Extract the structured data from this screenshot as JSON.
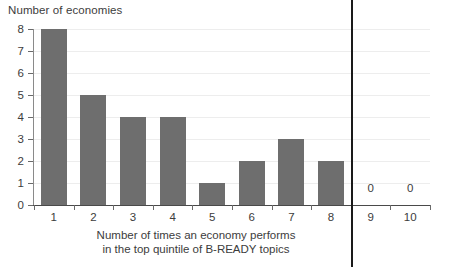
{
  "chart_data": {
    "type": "bar",
    "title": "",
    "ylabel": "Number of economies",
    "xlabel_lines": [
      "Number of times an economy performs",
      "in the top quintile of B-READY topics"
    ],
    "xlabel": "Number of times an economy performs in the top quintile of B-READY topics",
    "categories": [
      "1",
      "2",
      "3",
      "4",
      "5",
      "6",
      "7",
      "8",
      "9",
      "10"
    ],
    "values": [
      8,
      5,
      4,
      4,
      1,
      2,
      3,
      2,
      0,
      0
    ],
    "value_labels": [
      "",
      "",
      "",
      "",
      "",
      "",
      "",
      "",
      "0",
      "0"
    ],
    "ylim": [
      0,
      8
    ],
    "y_ticks": [
      "0",
      "1",
      "2",
      "3",
      "4",
      "5",
      "6",
      "7",
      "8"
    ],
    "grid": true,
    "legend": "none",
    "annotations": [
      {
        "name": "category-divider",
        "kind": "vertical-line",
        "after_category": "8",
        "description": "vertical rule separating categories 1-8 from 9-10"
      }
    ],
    "colors": {
      "bar": "#6e6e6e",
      "grid": "#ededed",
      "axis": "#4a4a4a",
      "divider": "#1a1a1a",
      "text": "#3c3c3c",
      "background": "#ffffff"
    }
  }
}
